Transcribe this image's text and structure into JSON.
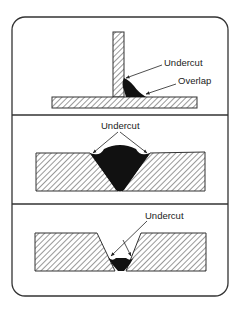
{
  "figure": {
    "panels": [
      {
        "id": "fillet-weld",
        "labels": [
          {
            "text": "Undercut"
          },
          {
            "text": "Overlap"
          }
        ]
      },
      {
        "id": "groove-weld-large",
        "labels": [
          {
            "text": "Undercut"
          }
        ]
      },
      {
        "id": "groove-weld-root",
        "labels": [
          {
            "text": "Undercut"
          }
        ]
      }
    ]
  }
}
